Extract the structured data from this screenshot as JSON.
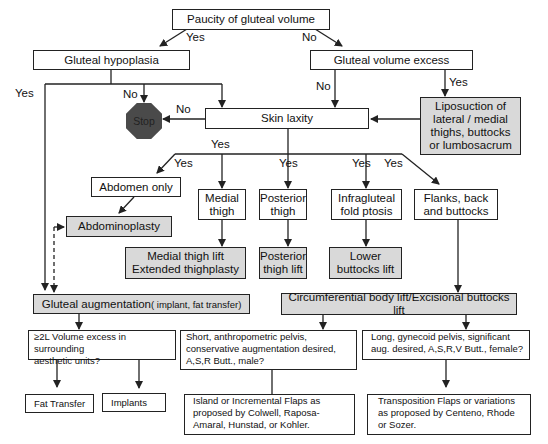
{
  "nodes": {
    "paucity": "Paucity of gluteal volume",
    "hypoplasia": "Gluteal hypoplasia",
    "volume_excess": "Gluteal volume excess",
    "liposuction": [
      "Liposuction of",
      "lateral / medial",
      "thighs, buttocks",
      "or lumbosacrum"
    ],
    "skin_laxity": "Skin laxity",
    "stop": "Stop",
    "abdomen_only": "Abdomen only",
    "abdominoplasty": "Abdominoplasty",
    "medial_thigh": [
      "Medial",
      "thigh"
    ],
    "medial_thigh_lift": [
      "Medial thigh lift",
      "Extended thighplasty"
    ],
    "posterior_thigh": [
      "Posterior",
      "thigh"
    ],
    "posterior_thigh_lift": [
      "Posterior",
      "thigh lift"
    ],
    "infragluteal": [
      "Infragluteal",
      "fold ptosis"
    ],
    "lower_buttocks_lift": [
      "Lower",
      "buttocks lift"
    ],
    "flanks": [
      "Flanks, back",
      "and buttocks"
    ],
    "gluteal_augmentation": "Gluteal augmentation",
    "gluteal_augmentation_sub": "( implant, fat transfer)",
    "circumferential": "Circumferential body lift/Excisional buttocks lift",
    "volume_excess_q": [
      "≥2L Volume excess in surrounding",
      "aesthetic units?"
    ],
    "short_pelvis_q": [
      "Short, anthropometric pelvis,",
      "conservative augmentation desired,",
      "A,S,R Butt., male?"
    ],
    "long_pelvis_q": [
      "Long, gynecoid pelvis, significant",
      "aug. desired, A,S,R,V Butt., female?"
    ],
    "fat_transfer": "Fat Transfer",
    "implants": "Implants",
    "island_flaps": [
      "Island or Incremental Flaps as",
      "proposed by Colwell, Raposa-",
      "Amaral, Hunstad, or Kohler."
    ],
    "transposition_flaps": [
      "Transposition Flaps or variations",
      "as proposed by Centeno, Rhode",
      "or Sozer."
    ]
  },
  "edge_labels": {
    "paucity_yes": "Yes",
    "paucity_no": "No",
    "hypoplasia_yes": "Yes",
    "hypoplasia_no": "No",
    "excess_no": "No",
    "excess_yes": "Yes",
    "laxity_no": "No",
    "laxity_yes": "Yes",
    "abdomen_yes": "Yes",
    "posterior_yes": "Yes",
    "infragluteal_yes": "Yes",
    "flanks_yes": "Yes"
  },
  "colors": {
    "highlight_fill": "#d9d9d9",
    "stop_fill": "#4a4a4a",
    "line": "#222222"
  }
}
